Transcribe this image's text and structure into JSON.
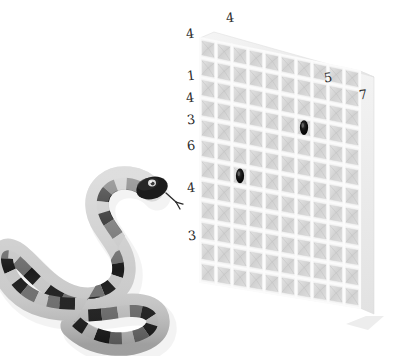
{
  "scene": {
    "title": "Snake beside perspective grid panel",
    "background_color": "#ffffff"
  },
  "annotations": {
    "label": "handwritten-digit-annotations",
    "ink_color": "#2b2b2b",
    "top_row": [
      {
        "id": "top-left-4",
        "value": "4",
        "x": 186,
        "y": 27
      },
      {
        "id": "top-4",
        "value": "4",
        "x": 226,
        "y": 11
      },
      {
        "id": "top-right-5",
        "value": "5",
        "x": 324,
        "y": 71
      },
      {
        "id": "top-right-7",
        "value": "7",
        "x": 359,
        "y": 88
      }
    ],
    "left_column": [
      {
        "id": "left-1",
        "value": "1",
        "x": 187,
        "y": 69
      },
      {
        "id": "left-4a",
        "value": "4",
        "x": 186,
        "y": 91
      },
      {
        "id": "left-3a",
        "value": "3",
        "x": 187,
        "y": 113
      },
      {
        "id": "left-6",
        "value": "6",
        "x": 187,
        "y": 139
      },
      {
        "id": "left-4b",
        "value": "4",
        "x": 187,
        "y": 181
      },
      {
        "id": "left-3b",
        "value": "3",
        "x": 188,
        "y": 229
      }
    ]
  },
  "grid_panel": {
    "label": "perspective-grid-panel",
    "columns": 10,
    "rows": 12,
    "cell_fill": "#d6d6d6",
    "gridline_color": "#fbfbfb",
    "edge_color": "#e8e8e8",
    "side_face_color": "#efefef",
    "shadow_color": "#ededed",
    "marks": [
      {
        "id": "mark-upper",
        "column": 6,
        "row": 3,
        "color": "#101010",
        "shape": "ellipse"
      },
      {
        "id": "mark-lower",
        "column": 2,
        "row": 6,
        "color": "#101010",
        "shape": "ellipse"
      }
    ]
  },
  "snake": {
    "label": "banded-snake",
    "pose": "s-curve",
    "band_colors": {
      "dark": "#1b1b1b",
      "mid": "#6e6e6e",
      "light": "#c8c8c8"
    },
    "eye_color": "#e0e0e0",
    "tongue_color": "#2a2a2a",
    "shadow_color": "#e9e9e9",
    "band_sequence": [
      "dark",
      "mid",
      "light",
      "mid",
      "dark",
      "light"
    ]
  }
}
